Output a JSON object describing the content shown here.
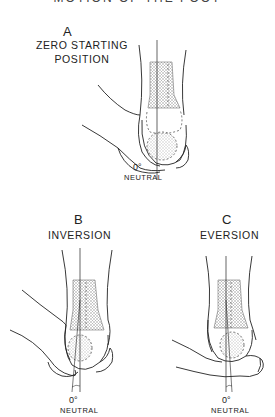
{
  "figure": {
    "title": "MOTION OF THE FOOT",
    "panels": [
      {
        "letter": "A",
        "caption_line1": "ZERO STARTING",
        "caption_line2": "POSITION",
        "angle": "0°",
        "angle_label": "NEUTRAL"
      },
      {
        "letter": "B",
        "caption_line1": "INVERSION",
        "angle": "0°",
        "angle_label": "NEUTRAL"
      },
      {
        "letter": "C",
        "caption_line1": "EVERSION",
        "angle": "0°",
        "angle_label": "NEUTRAL"
      }
    ],
    "colors": {
      "ink": "#222222",
      "stipple": "#9a9a9a",
      "background": "#ffffff"
    }
  }
}
